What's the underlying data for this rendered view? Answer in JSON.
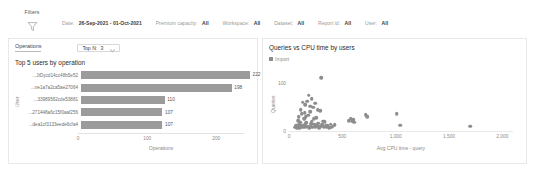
{
  "filters": {
    "pane_label": "Filters",
    "icon": "funnel-icon",
    "items": [
      {
        "key": "Date:",
        "value": "26-Sep-2021 - 01-Oct-2021"
      },
      {
        "key": "Premium capacity:",
        "value": "All"
      },
      {
        "key": "Workspace:",
        "value": "All"
      },
      {
        "key": "Dataset:",
        "value": "All"
      },
      {
        "key": "Report id:",
        "value": "All"
      },
      {
        "key": "User:",
        "value": "All"
      }
    ]
  },
  "left_card": {
    "tab_label": "Operations",
    "topn": {
      "label": "Top N:",
      "value": "3",
      "icon": "chevron-down-icon"
    }
  },
  "right_card": {},
  "colors": {
    "bar": "#9b9b9b",
    "dot": "#8d8d8d",
    "card_border": "#e8e8e8",
    "axis_text": "#8a8a8a"
  },
  "chart_data": [
    {
      "type": "bar",
      "title": "Top 5 users by operation",
      "orientation": "horizontal",
      "categories": [
        "JtDycd14cc48b5e52...",
        "ne1a7a2ca5ae27064...",
        "33989562cde53881...",
        "271448a6c15f0aaf256...",
        "dea1cf3133eede6cfa4..."
      ],
      "values": [
        222,
        198,
        110,
        107,
        107
      ],
      "xlabel": "Operations",
      "ylabel": "User",
      "xticks": [
        0,
        100,
        200
      ],
      "xlim": [
        0,
        240
      ],
      "grid": false,
      "legend": null
    },
    {
      "type": "scatter",
      "title": "Queries vs CPU time by users",
      "legend": [
        "Import"
      ],
      "legend_position": "top-left",
      "xlabel": "Avg CPU time - query",
      "ylabel": "Queries",
      "xticks": [
        "0",
        "500",
        "1,000",
        "1,500",
        "2,000"
      ],
      "xtick_values": [
        0,
        500,
        1000,
        1500,
        2000
      ],
      "yticks": [
        "0",
        "100"
      ],
      "ytick_values": [
        0,
        100
      ],
      "xlim": [
        0,
        2100
      ],
      "ylim": [
        0,
        130
      ],
      "grid": false,
      "series": [
        {
          "name": "Import",
          "points": [
            [
              60,
              8
            ],
            [
              70,
              12
            ],
            [
              78,
              6
            ],
            [
              85,
              22
            ],
            [
              88,
              10
            ],
            [
              92,
              30
            ],
            [
              96,
              14
            ],
            [
              100,
              7
            ],
            [
              104,
              18
            ],
            [
              110,
              45
            ],
            [
              115,
              9
            ],
            [
              120,
              36
            ],
            [
              124,
              11
            ],
            [
              130,
              60
            ],
            [
              134,
              8
            ],
            [
              140,
              26
            ],
            [
              146,
              13
            ],
            [
              152,
              55
            ],
            [
              158,
              9
            ],
            [
              164,
              17
            ],
            [
              170,
              62
            ],
            [
              176,
              10
            ],
            [
              182,
              33
            ],
            [
              188,
              7
            ],
            [
              196,
              40
            ],
            [
              204,
              12
            ],
            [
              212,
              20
            ],
            [
              220,
              8
            ],
            [
              228,
              50
            ],
            [
              236,
              14
            ],
            [
              245,
              9
            ],
            [
              256,
              28
            ],
            [
              265,
              11
            ],
            [
              274,
              16
            ],
            [
              283,
              7
            ],
            [
              292,
              42
            ],
            [
              300,
              10
            ],
            [
              312,
              13
            ],
            [
              324,
              8
            ],
            [
              336,
              19
            ],
            [
              350,
              9
            ],
            [
              362,
              12
            ],
            [
              378,
              7
            ],
            [
              392,
              14
            ],
            [
              410,
              10
            ],
            [
              300,
              112
            ],
            [
              186,
              75
            ],
            [
              212,
              68
            ],
            [
              246,
              58
            ],
            [
              268,
              44
            ],
            [
              158,
              30
            ],
            [
              148,
              38
            ],
            [
              196,
              52
            ],
            [
              232,
              25
            ],
            [
              208,
              15
            ],
            [
              252,
              12
            ],
            [
              276,
              9
            ],
            [
              318,
              20
            ],
            [
              346,
              11
            ],
            [
              402,
              8
            ],
            [
              430,
              13
            ],
            [
              560,
              22
            ],
            [
              580,
              26
            ],
            [
              600,
              24
            ],
            [
              612,
              18
            ],
            [
              590,
              20
            ],
            [
              720,
              34
            ],
            [
              735,
              30
            ],
            [
              1010,
              36
            ],
            [
              1045,
              12
            ],
            [
              1700,
              10
            ]
          ]
        }
      ]
    }
  ]
}
